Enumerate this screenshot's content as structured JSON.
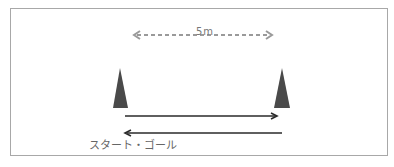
{
  "diagram": {
    "distance_label": "5m",
    "caption": "スタート・ゴール",
    "colors": {
      "cone": "#4a4a4a",
      "arrow": "#2a2a2a",
      "dashed_arrow": "#9a9a9a",
      "frame": "#a8a8a8"
    },
    "elements": [
      {
        "type": "cone",
        "position": "left"
      },
      {
        "type": "cone",
        "position": "right"
      },
      {
        "type": "dashed-double-arrow",
        "label": "5m"
      },
      {
        "type": "arrow",
        "direction": "right"
      },
      {
        "type": "arrow",
        "direction": "left"
      }
    ]
  }
}
